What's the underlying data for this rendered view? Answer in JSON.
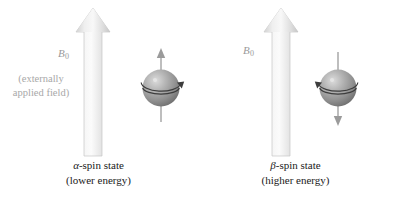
{
  "figure": {
    "background_color": "#ffffff"
  },
  "colors": {
    "field_arrow_light": "#f2f2f2",
    "field_arrow_mid": "#dedede",
    "field_arrow_edge": "#c9c9c9",
    "sphere_highlight": "#d7d7d7",
    "sphere_mid": "#9a9a9a",
    "sphere_dark": "#6e6e6e",
    "spin_arrow": "#8f8f8f",
    "equator_line": "#4a4a4a",
    "caption_text": "#1a1a1a",
    "muted_text": "#a8a8a8"
  },
  "panels": [
    {
      "id": "alpha",
      "field_label": "B",
      "field_subscript": "0",
      "field_note_line1": "(externally",
      "field_note_line2": "applied field)",
      "field_arrow_direction": "up",
      "spin_arrow_direction": "up",
      "precession_side": "right",
      "caption_greek": "α",
      "caption_line1_rest": "-spin state",
      "caption_line2": "(lower energy)"
    },
    {
      "id": "beta",
      "field_label": "B",
      "field_subscript": "0",
      "field_note_line1": "",
      "field_note_line2": "",
      "field_arrow_direction": "up",
      "spin_arrow_direction": "down",
      "precession_side": "left",
      "caption_greek": "β",
      "caption_line1_rest": "-spin state",
      "caption_line2": "(higher energy)"
    }
  ],
  "icons": {
    "field_arrow": "up-arrow-icon",
    "nucleus": "sphere-icon",
    "spin_vector_up": "up-arrow-icon",
    "spin_vector_down": "down-arrow-icon",
    "precession": "curved-arrow-icon"
  }
}
